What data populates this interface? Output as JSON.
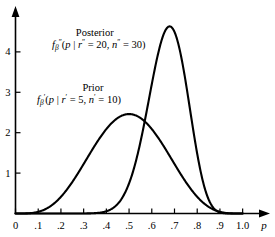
{
  "chart_data": {
    "type": "line",
    "title": "",
    "xlabel": "p",
    "ylabel": "",
    "xlim": [
      0,
      1.05
    ],
    "ylim": [
      0,
      4.95
    ],
    "grid": false,
    "legend_position": "inline-annotations",
    "xticks": [
      "0",
      ".1",
      ".2",
      ".3",
      ".4",
      ".5",
      ".6",
      ".7",
      ".8",
      ".9",
      "1.0"
    ],
    "xtick_values": [
      0,
      0.1,
      0.2,
      0.3,
      0.4,
      0.5,
      0.6,
      0.7,
      0.8,
      0.9,
      1.0
    ],
    "yticks": [
      "1",
      "2",
      "3",
      "4"
    ],
    "ytick_values": [
      1,
      2,
      3,
      4
    ],
    "series": [
      {
        "name": "Prior",
        "distribution": "beta",
        "r": 5,
        "n": 10,
        "alpha": 5,
        "beta": 5,
        "peak_x": 0.5,
        "peak_y": 2.46,
        "x": [
          0.0,
          0.05,
          0.1,
          0.15,
          0.2,
          0.25,
          0.3,
          0.35,
          0.4,
          0.45,
          0.5,
          0.55,
          0.6,
          0.65,
          0.7,
          0.75,
          0.8,
          0.85,
          0.9,
          0.95,
          1.0
        ],
        "values": [
          0.0,
          0.02,
          0.11,
          0.33,
          0.72,
          1.24,
          1.78,
          2.21,
          2.43,
          2.46,
          2.46,
          2.43,
          2.21,
          1.78,
          1.24,
          0.72,
          0.33,
          0.11,
          0.02,
          0.0,
          0.0
        ]
      },
      {
        "name": "Posterior",
        "distribution": "beta",
        "r": 20,
        "n": 30,
        "alpha": 20,
        "beta": 10,
        "peak_x": 0.67,
        "peak_y": 4.72,
        "x": [
          0.0,
          0.05,
          0.1,
          0.15,
          0.2,
          0.25,
          0.3,
          0.35,
          0.4,
          0.45,
          0.5,
          0.55,
          0.6,
          0.65,
          0.67,
          0.7,
          0.75,
          0.8,
          0.85,
          0.9,
          0.95,
          1.0
        ],
        "values": [
          0.0,
          0.0,
          0.0,
          0.0,
          0.0,
          0.01,
          0.05,
          0.19,
          0.53,
          1.16,
          2.06,
          3.09,
          4.01,
          4.58,
          4.72,
          4.61,
          3.89,
          2.56,
          1.1,
          0.2,
          0.0,
          0.0
        ]
      }
    ],
    "annotations": [
      {
        "name": "posterior-annotation",
        "title": "Posterior",
        "formula_f": "f",
        "formula_sub": "β",
        "formula_sup": "″",
        "formula_body_pre": "(",
        "formula_p": "p",
        "formula_bar": " | ",
        "formula_r": "r",
        "formula_r_sup": "″",
        "formula_r_val": " = 20, ",
        "formula_n": "n",
        "formula_n_sup": "″",
        "formula_n_val": " = 30)"
      },
      {
        "name": "prior-annotation",
        "title": "Prior",
        "formula_f": "f",
        "formula_sub": "β",
        "formula_sup": "′",
        "formula_body_pre": "(",
        "formula_p": "p",
        "formula_bar": " | ",
        "formula_r": "r",
        "formula_r_sup": "′",
        "formula_r_val": " = 5, ",
        "formula_n": "n",
        "formula_n_sup": "′",
        "formula_n_val": " = 10)"
      }
    ],
    "colors": {
      "curve": "#000000",
      "axis": "#000000",
      "background": "#ffffff"
    }
  }
}
